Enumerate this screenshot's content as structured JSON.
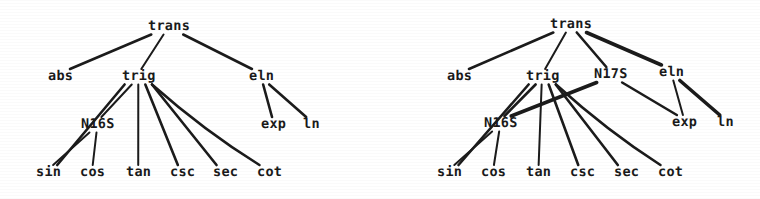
{
  "figure": {
    "kind": "two-derivation-trees",
    "background_color": "#ffffff",
    "ink_color": "#1b1b1b",
    "width": 760,
    "height": 199
  },
  "trees": [
    {
      "id": "left-tree",
      "name": "left-derivation-tree",
      "nodes": [
        {
          "id": "L-trans",
          "label": "trans",
          "x": 148,
          "y": 20
        },
        {
          "id": "L-abs",
          "label": "abs",
          "x": 48,
          "y": 70
        },
        {
          "id": "L-trig",
          "label": "trig",
          "x": 122,
          "y": 70
        },
        {
          "id": "L-eln",
          "label": "eln",
          "x": 249,
          "y": 70
        },
        {
          "id": "L-N16S",
          "label": "N16S",
          "x": 81,
          "y": 118
        },
        {
          "id": "L-exp",
          "label": "exp",
          "x": 261,
          "y": 118
        },
        {
          "id": "L-ln",
          "label": "ln",
          "x": 303,
          "y": 118
        },
        {
          "id": "L-sin",
          "label": "sin",
          "x": 36,
          "y": 166
        },
        {
          "id": "L-cos",
          "label": "cos",
          "x": 80,
          "y": 166
        },
        {
          "id": "L-tan",
          "label": "tan",
          "x": 126,
          "y": 166
        },
        {
          "id": "L-csc",
          "label": "csc",
          "x": 170,
          "y": 166
        },
        {
          "id": "L-sec",
          "label": "sec",
          "x": 213,
          "y": 166
        },
        {
          "id": "L-cot",
          "label": "cot",
          "x": 257,
          "y": 166
        }
      ],
      "edges": [
        {
          "from": "L-trans",
          "to": "L-abs",
          "weight": "med"
        },
        {
          "from": "L-trans",
          "to": "L-trig",
          "weight": "thin"
        },
        {
          "from": "L-trans",
          "to": "L-eln",
          "weight": "med"
        },
        {
          "from": "L-trig",
          "to": "L-N16S",
          "weight": "thin"
        },
        {
          "from": "L-trig",
          "to": "L-sin",
          "weight": "med"
        },
        {
          "from": "L-trig",
          "to": "L-tan",
          "weight": "thin"
        },
        {
          "from": "L-trig",
          "to": "L-csc",
          "weight": "med"
        },
        {
          "from": "L-trig",
          "to": "L-sec",
          "weight": "med"
        },
        {
          "from": "L-trig",
          "to": "L-cot",
          "weight": "med"
        },
        {
          "from": "L-N16S",
          "to": "L-sin",
          "weight": "thin"
        },
        {
          "from": "L-N16S",
          "to": "L-cos",
          "weight": "thin"
        },
        {
          "from": "L-eln",
          "to": "L-exp",
          "weight": "med"
        },
        {
          "from": "L-eln",
          "to": "L-ln",
          "weight": "med"
        }
      ]
    },
    {
      "id": "right-tree",
      "name": "right-derivation-tree",
      "nodes": [
        {
          "id": "R-trans",
          "label": "trans",
          "x": 550,
          "y": 18
        },
        {
          "id": "R-abs",
          "label": "abs",
          "x": 447,
          "y": 70
        },
        {
          "id": "R-trig",
          "label": "trig",
          "x": 526,
          "y": 70
        },
        {
          "id": "R-N17S",
          "label": "N17S",
          "x": 594,
          "y": 68
        },
        {
          "id": "R-eln",
          "label": "eln",
          "x": 659,
          "y": 66
        },
        {
          "id": "R-N16S",
          "label": "N16S",
          "x": 484,
          "y": 117
        },
        {
          "id": "R-exp",
          "label": "exp",
          "x": 672,
          "y": 116
        },
        {
          "id": "R-ln",
          "label": "ln",
          "x": 717,
          "y": 116
        },
        {
          "id": "R-sin",
          "label": "sin",
          "x": 437,
          "y": 166
        },
        {
          "id": "R-cos",
          "label": "cos",
          "x": 481,
          "y": 166
        },
        {
          "id": "R-tan",
          "label": "tan",
          "x": 526,
          "y": 166
        },
        {
          "id": "R-csc",
          "label": "csc",
          "x": 570,
          "y": 166
        },
        {
          "id": "R-sec",
          "label": "sec",
          "x": 614,
          "y": 166
        },
        {
          "id": "R-cot",
          "label": "cot",
          "x": 658,
          "y": 166
        }
      ],
      "edges": [
        {
          "from": "R-trans",
          "to": "R-abs",
          "weight": "med"
        },
        {
          "from": "R-trans",
          "to": "R-trig",
          "weight": "thin"
        },
        {
          "from": "R-trans",
          "to": "R-N17S",
          "weight": "med"
        },
        {
          "from": "R-trans",
          "to": "R-eln",
          "weight": "thick"
        },
        {
          "from": "R-trig",
          "to": "R-N16S",
          "weight": "med"
        },
        {
          "from": "R-trig",
          "to": "R-sin",
          "weight": "med"
        },
        {
          "from": "R-trig",
          "to": "R-tan",
          "weight": "thin"
        },
        {
          "from": "R-trig",
          "to": "R-csc",
          "weight": "med"
        },
        {
          "from": "R-trig",
          "to": "R-sec",
          "weight": "med"
        },
        {
          "from": "R-trig",
          "to": "R-cot",
          "weight": "med"
        },
        {
          "from": "R-N16S",
          "to": "R-sin",
          "weight": "thin"
        },
        {
          "from": "R-N16S",
          "to": "R-cos",
          "weight": "thin"
        },
        {
          "from": "R-N17S",
          "to": "R-N16S",
          "weight": "thick"
        },
        {
          "from": "R-N17S",
          "to": "R-exp",
          "weight": "med"
        },
        {
          "from": "R-eln",
          "to": "R-exp",
          "weight": "thin"
        },
        {
          "from": "R-eln",
          "to": "R-ln",
          "weight": "thick"
        }
      ]
    }
  ]
}
